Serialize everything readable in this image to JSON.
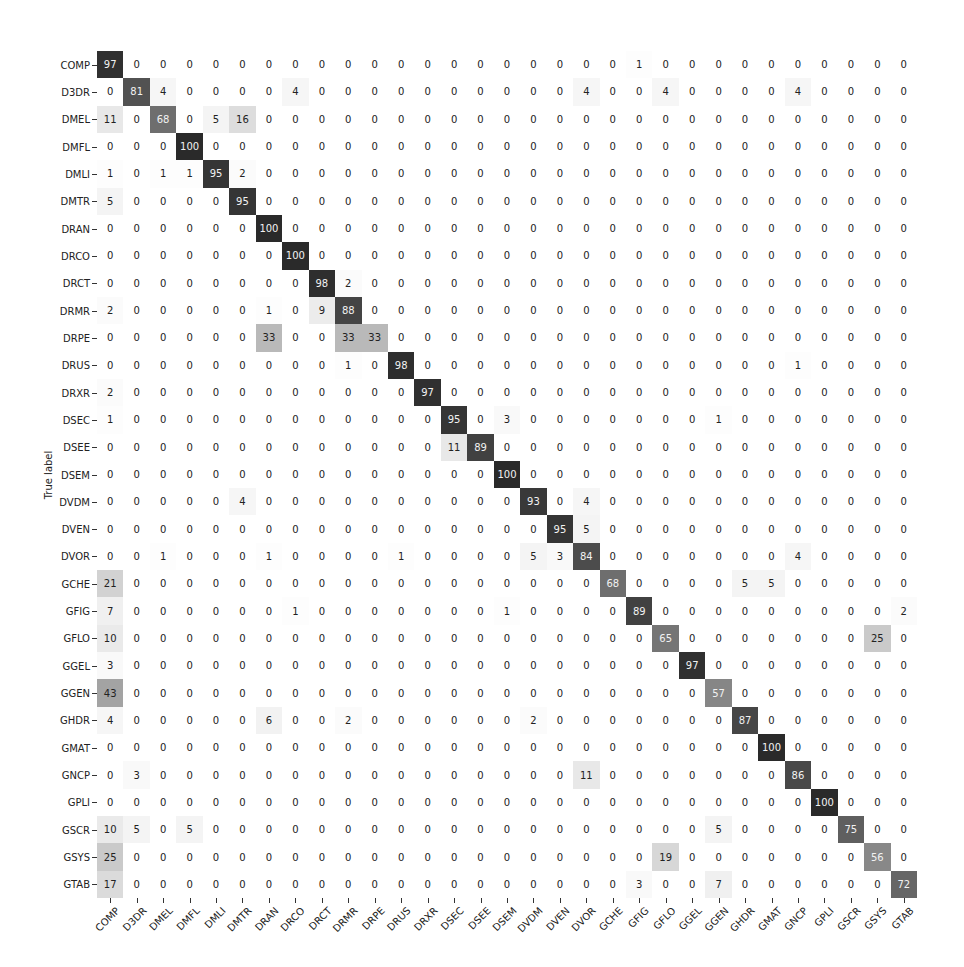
{
  "chart_data": {
    "type": "heatmap",
    "title": "",
    "xlabel": "",
    "ylabel": "True label",
    "colormap": "Greys",
    "value_range": [
      0,
      100
    ],
    "grid": false,
    "legend": "none",
    "labels": [
      "COMP",
      "D3DR",
      "DMEL",
      "DMFL",
      "DMLI",
      "DMTR",
      "DRAN",
      "DRCO",
      "DRCT",
      "DRMR",
      "DRPE",
      "DRUS",
      "DRXR",
      "DSEC",
      "DSEE",
      "DSEM",
      "DVDM",
      "DVEN",
      "DVOR",
      "GCHE",
      "GFIG",
      "GFLO",
      "GGEL",
      "GGEN",
      "GHDR",
      "GMAT",
      "GNCP",
      "GPLI",
      "GSCR",
      "GSYS",
      "GTAB"
    ],
    "matrix": [
      [
        97,
        0,
        0,
        0,
        0,
        0,
        0,
        0,
        0,
        0,
        0,
        0,
        0,
        0,
        0,
        0,
        0,
        0,
        0,
        0,
        1,
        0,
        0,
        0,
        0,
        0,
        0,
        0,
        0,
        0,
        0
      ],
      [
        0,
        81,
        4,
        0,
        0,
        0,
        0,
        4,
        0,
        0,
        0,
        0,
        0,
        0,
        0,
        0,
        0,
        0,
        4,
        0,
        0,
        4,
        0,
        0,
        0,
        0,
        4,
        0,
        0,
        0,
        0
      ],
      [
        11,
        0,
        68,
        0,
        5,
        16,
        0,
        0,
        0,
        0,
        0,
        0,
        0,
        0,
        0,
        0,
        0,
        0,
        0,
        0,
        0,
        0,
        0,
        0,
        0,
        0,
        0,
        0,
        0,
        0,
        0
      ],
      [
        0,
        0,
        0,
        100,
        0,
        0,
        0,
        0,
        0,
        0,
        0,
        0,
        0,
        0,
        0,
        0,
        0,
        0,
        0,
        0,
        0,
        0,
        0,
        0,
        0,
        0,
        0,
        0,
        0,
        0,
        0
      ],
      [
        1,
        0,
        1,
        1,
        95,
        2,
        0,
        0,
        0,
        0,
        0,
        0,
        0,
        0,
        0,
        0,
        0,
        0,
        0,
        0,
        0,
        0,
        0,
        0,
        0,
        0,
        0,
        0,
        0,
        0,
        0
      ],
      [
        5,
        0,
        0,
        0,
        0,
        95,
        0,
        0,
        0,
        0,
        0,
        0,
        0,
        0,
        0,
        0,
        0,
        0,
        0,
        0,
        0,
        0,
        0,
        0,
        0,
        0,
        0,
        0,
        0,
        0,
        0
      ],
      [
        0,
        0,
        0,
        0,
        0,
        0,
        100,
        0,
        0,
        0,
        0,
        0,
        0,
        0,
        0,
        0,
        0,
        0,
        0,
        0,
        0,
        0,
        0,
        0,
        0,
        0,
        0,
        0,
        0,
        0,
        0
      ],
      [
        0,
        0,
        0,
        0,
        0,
        0,
        0,
        100,
        0,
        0,
        0,
        0,
        0,
        0,
        0,
        0,
        0,
        0,
        0,
        0,
        0,
        0,
        0,
        0,
        0,
        0,
        0,
        0,
        0,
        0,
        0
      ],
      [
        0,
        0,
        0,
        0,
        0,
        0,
        0,
        0,
        98,
        2,
        0,
        0,
        0,
        0,
        0,
        0,
        0,
        0,
        0,
        0,
        0,
        0,
        0,
        0,
        0,
        0,
        0,
        0,
        0,
        0,
        0
      ],
      [
        2,
        0,
        0,
        0,
        0,
        0,
        1,
        0,
        9,
        88,
        0,
        0,
        0,
        0,
        0,
        0,
        0,
        0,
        0,
        0,
        0,
        0,
        0,
        0,
        0,
        0,
        0,
        0,
        0,
        0,
        0
      ],
      [
        0,
        0,
        0,
        0,
        0,
        0,
        33,
        0,
        0,
        33,
        33,
        0,
        0,
        0,
        0,
        0,
        0,
        0,
        0,
        0,
        0,
        0,
        0,
        0,
        0,
        0,
        0,
        0,
        0,
        0,
        0
      ],
      [
        0,
        0,
        0,
        0,
        0,
        0,
        0,
        0,
        0,
        1,
        0,
        98,
        0,
        0,
        0,
        0,
        0,
        0,
        0,
        0,
        0,
        0,
        0,
        0,
        0,
        0,
        1,
        0,
        0,
        0,
        0
      ],
      [
        2,
        0,
        0,
        0,
        0,
        0,
        0,
        0,
        0,
        0,
        0,
        0,
        97,
        0,
        0,
        0,
        0,
        0,
        0,
        0,
        0,
        0,
        0,
        0,
        0,
        0,
        0,
        0,
        0,
        0,
        0
      ],
      [
        1,
        0,
        0,
        0,
        0,
        0,
        0,
        0,
        0,
        0,
        0,
        0,
        0,
        95,
        0,
        3,
        0,
        0,
        0,
        0,
        0,
        0,
        0,
        1,
        0,
        0,
        0,
        0,
        0,
        0,
        0
      ],
      [
        0,
        0,
        0,
        0,
        0,
        0,
        0,
        0,
        0,
        0,
        0,
        0,
        0,
        11,
        89,
        0,
        0,
        0,
        0,
        0,
        0,
        0,
        0,
        0,
        0,
        0,
        0,
        0,
        0,
        0,
        0
      ],
      [
        0,
        0,
        0,
        0,
        0,
        0,
        0,
        0,
        0,
        0,
        0,
        0,
        0,
        0,
        0,
        100,
        0,
        0,
        0,
        0,
        0,
        0,
        0,
        0,
        0,
        0,
        0,
        0,
        0,
        0,
        0
      ],
      [
        0,
        0,
        0,
        0,
        0,
        4,
        0,
        0,
        0,
        0,
        0,
        0,
        0,
        0,
        0,
        0,
        93,
        0,
        4,
        0,
        0,
        0,
        0,
        0,
        0,
        0,
        0,
        0,
        0,
        0,
        0
      ],
      [
        0,
        0,
        0,
        0,
        0,
        0,
        0,
        0,
        0,
        0,
        0,
        0,
        0,
        0,
        0,
        0,
        0,
        95,
        5,
        0,
        0,
        0,
        0,
        0,
        0,
        0,
        0,
        0,
        0,
        0,
        0
      ],
      [
        0,
        0,
        1,
        0,
        0,
        0,
        1,
        0,
        0,
        0,
        0,
        1,
        0,
        0,
        0,
        0,
        5,
        3,
        84,
        0,
        0,
        0,
        0,
        0,
        0,
        0,
        4,
        0,
        0,
        0,
        0
      ],
      [
        21,
        0,
        0,
        0,
        0,
        0,
        0,
        0,
        0,
        0,
        0,
        0,
        0,
        0,
        0,
        0,
        0,
        0,
        0,
        68,
        0,
        0,
        0,
        0,
        5,
        5,
        0,
        0,
        0,
        0,
        0
      ],
      [
        7,
        0,
        0,
        0,
        0,
        0,
        0,
        1,
        0,
        0,
        0,
        0,
        0,
        0,
        0,
        1,
        0,
        0,
        0,
        0,
        89,
        0,
        0,
        0,
        0,
        0,
        0,
        0,
        0,
        0,
        2
      ],
      [
        10,
        0,
        0,
        0,
        0,
        0,
        0,
        0,
        0,
        0,
        0,
        0,
        0,
        0,
        0,
        0,
        0,
        0,
        0,
        0,
        0,
        65,
        0,
        0,
        0,
        0,
        0,
        0,
        0,
        25,
        0
      ],
      [
        3,
        0,
        0,
        0,
        0,
        0,
        0,
        0,
        0,
        0,
        0,
        0,
        0,
        0,
        0,
        0,
        0,
        0,
        0,
        0,
        0,
        0,
        97,
        0,
        0,
        0,
        0,
        0,
        0,
        0,
        0
      ],
      [
        43,
        0,
        0,
        0,
        0,
        0,
        0,
        0,
        0,
        0,
        0,
        0,
        0,
        0,
        0,
        0,
        0,
        0,
        0,
        0,
        0,
        0,
        0,
        57,
        0,
        0,
        0,
        0,
        0,
        0,
        0
      ],
      [
        4,
        0,
        0,
        0,
        0,
        0,
        6,
        0,
        0,
        2,
        0,
        0,
        0,
        0,
        0,
        0,
        2,
        0,
        0,
        0,
        0,
        0,
        0,
        0,
        87,
        0,
        0,
        0,
        0,
        0,
        0
      ],
      [
        0,
        0,
        0,
        0,
        0,
        0,
        0,
        0,
        0,
        0,
        0,
        0,
        0,
        0,
        0,
        0,
        0,
        0,
        0,
        0,
        0,
        0,
        0,
        0,
        0,
        100,
        0,
        0,
        0,
        0,
        0
      ],
      [
        0,
        3,
        0,
        0,
        0,
        0,
        0,
        0,
        0,
        0,
        0,
        0,
        0,
        0,
        0,
        0,
        0,
        0,
        11,
        0,
        0,
        0,
        0,
        0,
        0,
        0,
        86,
        0,
        0,
        0,
        0
      ],
      [
        0,
        0,
        0,
        0,
        0,
        0,
        0,
        0,
        0,
        0,
        0,
        0,
        0,
        0,
        0,
        0,
        0,
        0,
        0,
        0,
        0,
        0,
        0,
        0,
        0,
        0,
        0,
        100,
        0,
        0,
        0
      ],
      [
        10,
        5,
        0,
        5,
        0,
        0,
        0,
        0,
        0,
        0,
        0,
        0,
        0,
        0,
        0,
        0,
        0,
        0,
        0,
        0,
        0,
        0,
        0,
        5,
        0,
        0,
        0,
        0,
        75,
        0,
        0
      ],
      [
        25,
        0,
        0,
        0,
        0,
        0,
        0,
        0,
        0,
        0,
        0,
        0,
        0,
        0,
        0,
        0,
        0,
        0,
        0,
        0,
        0,
        19,
        0,
        0,
        0,
        0,
        0,
        0,
        0,
        56,
        0
      ],
      [
        17,
        0,
        0,
        0,
        0,
        0,
        0,
        0,
        0,
        0,
        0,
        0,
        0,
        0,
        0,
        0,
        0,
        0,
        0,
        0,
        3,
        0,
        0,
        7,
        0,
        0,
        0,
        0,
        0,
        0,
        72
      ]
    ]
  }
}
